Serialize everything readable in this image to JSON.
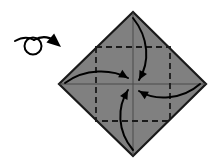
{
  "figure": {
    "background_color": "#ffffff",
    "width": 213,
    "height": 167
  },
  "paper": {
    "name": "square-paper-diamond",
    "fill_color": "#808080",
    "edge_color": "#1a1a1a",
    "edge_width": 2.2,
    "vertices": {
      "top": {
        "x": 133,
        "y": 12
      },
      "right": {
        "x": 206,
        "y": 84
      },
      "bottom": {
        "x": 133,
        "y": 156
      },
      "left": {
        "x": 59,
        "y": 84
      }
    },
    "center": {
      "x": 133,
      "y": 84
    }
  },
  "crease_lines": {
    "name": "center-cross-creases",
    "color": "#4a4a4a",
    "width": 1.0,
    "horizontal": {
      "x1": 59,
      "y1": 84,
      "x2": 206,
      "y2": 84
    },
    "vertical": {
      "x1": 133,
      "y1": 12,
      "x2": 133,
      "y2": 156
    }
  },
  "fold_square": {
    "name": "dashed-fold-square",
    "style": "dashed",
    "dash_pattern": "6,4",
    "color": "#1a1a1a",
    "width": 1.8,
    "left": 96,
    "top": 47,
    "right": 170,
    "bottom": 121
  },
  "arrows": [
    {
      "name": "fold-arrow-top",
      "from": "top-corner",
      "to": "center",
      "path": "M 133 18 C 149 38, 150 62, 139 80",
      "head_angle_deg": 118,
      "color": "#000000",
      "width": 2.0
    },
    {
      "name": "fold-arrow-left",
      "from": "left-corner",
      "to": "center",
      "path": "M 65 83 C 85 68, 112 69, 128 78",
      "head_angle_deg": 30,
      "color": "#000000",
      "width": 2.0
    },
    {
      "name": "fold-arrow-right",
      "from": "right-corner",
      "to": "center",
      "path": "M 200 84 C 182 100, 155 101, 139 91",
      "head_angle_deg": 210,
      "color": "#000000",
      "width": 2.0
    },
    {
      "name": "fold-arrow-bottom",
      "from": "bottom-corner",
      "to": "center",
      "path": "M 133 150 C 117 131, 117 107, 128 90",
      "head_angle_deg": 298,
      "color": "#000000",
      "width": 2.0
    }
  ],
  "turn_over_symbol": {
    "name": "turn-over-symbol",
    "color": "#000000",
    "loop": {
      "cx": 33,
      "cy": 46,
      "r": 8.5,
      "stroke_width": 2.0
    },
    "tail_path": "M 15 41 C 22 37, 29 37, 34 40",
    "lead_path": "M 34 40 C 41 36, 48 36, 55 41",
    "arrow_tip": {
      "x": 61,
      "y": 47
    },
    "arrow_head_angle_deg": 40
  }
}
